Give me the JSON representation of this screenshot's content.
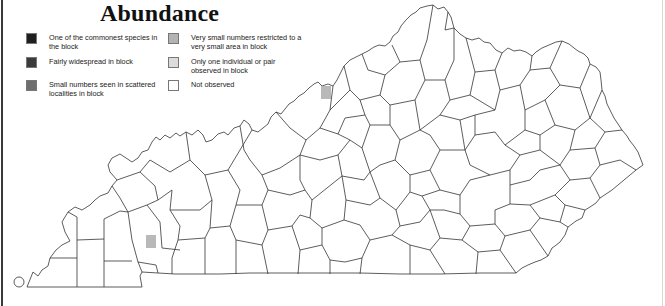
{
  "title": "Abundance",
  "legend": {
    "items": [
      {
        "key": "commonest",
        "label": "One of the commonest species in the block",
        "color": "#1f1f1f"
      },
      {
        "key": "widespread",
        "label": "Fairly widespread in block",
        "color": "#3b3b3b"
      },
      {
        "key": "scattered",
        "label": "Small numbers seen in scattered localities in block",
        "color": "#6e6e6e"
      },
      {
        "key": "very-small",
        "label": "Very small numbers restricted to a very small area in block",
        "color": "#b3b3b3"
      },
      {
        "key": "one-individual",
        "label": "Only one individual or pair observed in block",
        "color": "#dcdcdc"
      },
      {
        "key": "not-observed",
        "label": "Not observed",
        "color": "#ffffff"
      }
    ]
  },
  "map": {
    "region": "Kentucky counties",
    "outline_color": "#333333",
    "markers": [
      {
        "category": "very-small",
        "x": 321,
        "y": 86,
        "w": 10,
        "h": 13,
        "color": "#b9b9b9"
      },
      {
        "category": "very-small",
        "x": 146,
        "y": 235,
        "w": 10,
        "h": 13,
        "color": "#b9b9b9"
      }
    ]
  }
}
